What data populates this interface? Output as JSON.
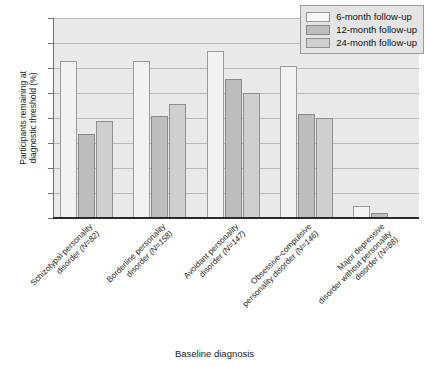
{
  "chart_data": {
    "type": "bar",
    "title": "",
    "xlabel": "Baseline diagnosis",
    "ylabel": "Participants remaining at\ndiagnostic threshold (%)",
    "ylim": [
      0,
      80
    ],
    "yticks": [
      0,
      10,
      20,
      30,
      40,
      50,
      60,
      70,
      80
    ],
    "grid": true,
    "legend_position": "top-right",
    "categories": [
      "Schizotypal personality disorder (N=82)",
      "Borderline personality disorder (N=158)",
      "Avoidant personality disorder (N=147)",
      "Obsessive-compulsive personality disorder (N=146)",
      "Major depressive disorder without personality disorder (N=88)"
    ],
    "category_lines": [
      [
        "Schizotypal personality",
        "disorder (N=82)"
      ],
      [
        "Borderline personality",
        "disorder (N=158)"
      ],
      [
        "Avoidant personality",
        "disorder (N=147)"
      ],
      [
        "Obsessive-compulsive",
        "personality disorder (N=146)"
      ],
      [
        "Major depressive",
        "disorder without personality",
        "disorder (N=88)"
      ]
    ],
    "series": [
      {
        "name": "6-month follow-up",
        "color": "#f2f2f2",
        "values": [
          63,
          63,
          67,
          61,
          5
        ]
      },
      {
        "name": "12-month follow-up",
        "color": "#bdbdbd",
        "values": [
          33.5,
          41,
          55.5,
          41.5,
          2
        ]
      },
      {
        "name": "24-month follow-up",
        "color": "#cfcfcf",
        "values": [
          39,
          45.5,
          50,
          40,
          0
        ]
      }
    ]
  },
  "legend": {
    "items": [
      {
        "label": "6-month follow-up"
      },
      {
        "label": "12-month follow-up"
      },
      {
        "label": "24-month follow-up"
      }
    ]
  },
  "axes": {
    "y_title": "Participants remaining at\ndiagnostic threshold (%)",
    "x_title": "Baseline diagnosis"
  }
}
